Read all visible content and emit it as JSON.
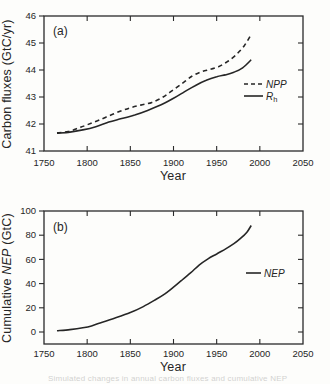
{
  "figure": {
    "caption_fragment": "Simulated changes in annual carbon fluxes and cumulative NEP"
  },
  "chart_data": [
    {
      "type": "line",
      "panel_label": "(a)",
      "xlabel": "Year",
      "ylabel": "Carbon fluxes (GtC/yr)",
      "xlim": [
        1750,
        2050
      ],
      "ylim": [
        41,
        46
      ],
      "xticks": [
        "1750",
        "1800",
        "1850",
        "1900",
        "1950",
        "2000",
        "2050"
      ],
      "yticks": [
        "41",
        "42",
        "43",
        "44",
        "45",
        "46"
      ],
      "grid": false,
      "legend_position": "right-middle",
      "series": [
        {
          "name": "NPP",
          "style": "dashed",
          "points": [
            [
              1765,
              41.67
            ],
            [
              1778,
              41.72
            ],
            [
              1790,
              41.85
            ],
            [
              1800,
              41.97
            ],
            [
              1812,
              42.12
            ],
            [
              1825,
              42.3
            ],
            [
              1838,
              42.47
            ],
            [
              1850,
              42.6
            ],
            [
              1862,
              42.7
            ],
            [
              1875,
              42.8
            ],
            [
              1888,
              43.0
            ],
            [
              1900,
              43.27
            ],
            [
              1912,
              43.55
            ],
            [
              1922,
              43.78
            ],
            [
              1932,
              43.93
            ],
            [
              1942,
              44.02
            ],
            [
              1952,
              44.12
            ],
            [
              1962,
              44.3
            ],
            [
              1972,
              44.55
            ],
            [
              1982,
              44.9
            ],
            [
              1990,
              45.32
            ]
          ]
        },
        {
          "name": "Rh",
          "legend_main": "R",
          "legend_sub": "h",
          "style": "solid",
          "points": [
            [
              1765,
              41.66
            ],
            [
              1780,
              41.7
            ],
            [
              1795,
              41.78
            ],
            [
              1810,
              41.9
            ],
            [
              1825,
              42.07
            ],
            [
              1840,
              42.2
            ],
            [
              1855,
              42.33
            ],
            [
              1870,
              42.5
            ],
            [
              1885,
              42.7
            ],
            [
              1900,
              42.95
            ],
            [
              1912,
              43.18
            ],
            [
              1925,
              43.42
            ],
            [
              1938,
              43.62
            ],
            [
              1950,
              43.75
            ],
            [
              1960,
              43.82
            ],
            [
              1970,
              43.92
            ],
            [
              1980,
              44.08
            ],
            [
              1990,
              44.38
            ]
          ]
        }
      ]
    },
    {
      "type": "line",
      "panel_label": "(b)",
      "xlabel": "Year",
      "ylabel": "Cumulative NEP (GtC)",
      "ylabel_parts": {
        "prefix": "Cumulative ",
        "italic": "NEP",
        "suffix": " (GtC)"
      },
      "xlim": [
        1750,
        2050
      ],
      "ylim": [
        0,
        100
      ],
      "xticks": [
        "1750",
        "1800",
        "1850",
        "1900",
        "1950",
        "2000",
        "2050"
      ],
      "yticks": [
        "0",
        "20",
        "40",
        "60",
        "80",
        "100"
      ],
      "grid": false,
      "legend_position": "right-middle",
      "series": [
        {
          "name": "NEP",
          "style": "solid",
          "points": [
            [
              1765,
              1
            ],
            [
              1780,
              2
            ],
            [
              1795,
              3.5
            ],
            [
              1805,
              5
            ],
            [
              1815,
              7.5
            ],
            [
              1830,
              11
            ],
            [
              1850,
              16
            ],
            [
              1865,
              21
            ],
            [
              1880,
              27
            ],
            [
              1890,
              31.5
            ],
            [
              1900,
              37
            ],
            [
              1910,
              43
            ],
            [
              1920,
              49
            ],
            [
              1930,
              55.5
            ],
            [
              1940,
              60.5
            ],
            [
              1950,
              64.5
            ],
            [
              1960,
              68.5
            ],
            [
              1970,
              73
            ],
            [
              1978,
              77.5
            ],
            [
              1985,
              82.5
            ],
            [
              1990,
              88
            ]
          ]
        }
      ]
    }
  ]
}
